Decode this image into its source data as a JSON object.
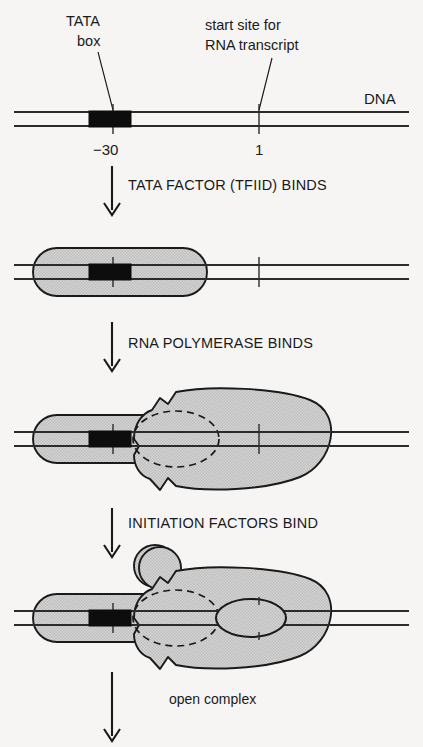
{
  "figure": {
    "background_color": "#f6f5f3",
    "ink_color": "#1a1a1a",
    "protein_fill_color": "#c9c9c9",
    "tata_box_color": "#0d0d0d"
  },
  "annotations": {
    "tata_label_line1": "TATA",
    "tata_label_line2": "box",
    "start_site_line1": "start site for",
    "start_site_line2": "RNA transcript",
    "dna_label": "DNA",
    "open_complex_label": "open complex"
  },
  "dna_positions": {
    "tata_tick_label": "−30",
    "start_site_tick_label": "1"
  },
  "steps": [
    {
      "index": 1,
      "label": "TATA FACTOR (TFIID) BINDS",
      "arrow": "down-arrow-icon"
    },
    {
      "index": 2,
      "label": "RNA POLYMERASE BINDS",
      "arrow": "down-arrow-icon"
    },
    {
      "index": 3,
      "label": "INITIATION FACTORS BIND",
      "arrow": "down-arrow-icon"
    },
    {
      "index": 4,
      "label": "",
      "arrow": "down-arrow-icon"
    }
  ],
  "stages": [
    {
      "index": 0,
      "name": "bare-dna",
      "components": [
        "dna-duplex",
        "tata-box",
        "minus30-tick",
        "plus1-tick"
      ]
    },
    {
      "index": 1,
      "name": "tfiid-bound",
      "components": [
        "dna-duplex",
        "tata-box",
        "tfiid-capsule"
      ]
    },
    {
      "index": 2,
      "name": "polymerase-bound",
      "components": [
        "dna-duplex",
        "tata-box",
        "tfiid-capsule",
        "rna-polymerase",
        "polymerase-cleft-dashed"
      ]
    },
    {
      "index": 3,
      "name": "open-complex",
      "components": [
        "dna-duplex",
        "tata-box",
        "tfiid-capsule",
        "rna-polymerase",
        "polymerase-cleft-dashed",
        "initiation-factor-circle",
        "dna-bubble"
      ]
    }
  ]
}
